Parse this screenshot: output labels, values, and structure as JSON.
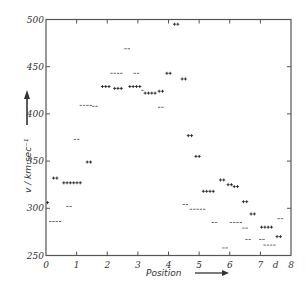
{
  "chart_data": {
    "type": "scatter",
    "title": "",
    "xlabel": "Position",
    "ylabel": "v / km sec⁻¹",
    "xlim": [
      0,
      8
    ],
    "ylim": [
      250,
      500
    ],
    "x_ticks": [
      {
        "value": 0,
        "label": "0"
      },
      {
        "value": 1,
        "label": "1"
      },
      {
        "value": 2,
        "label": "2"
      },
      {
        "value": 3,
        "label": "3"
      },
      {
        "value": 4,
        "label": "4"
      },
      {
        "value": 5,
        "label": "5"
      },
      {
        "value": 6,
        "label": "6"
      },
      {
        "value": 7,
        "label": "7"
      },
      {
        "value": 7.5,
        "label": "d"
      },
      {
        "value": 8,
        "label": "8"
      }
    ],
    "y_ticks": [
      250,
      300,
      350,
      400,
      450,
      500
    ],
    "grid": false,
    "legend": "none",
    "series": [
      {
        "name": "+",
        "marker": "+",
        "points": [
          {
            "x": 0.05,
            "y": 306,
            "n": 1
          },
          {
            "x": 0.3,
            "y": 332,
            "n": 2
          },
          {
            "x": 0.85,
            "y": 327,
            "n": 6
          },
          {
            "x": 1.4,
            "y": 349,
            "n": 2
          },
          {
            "x": 1.95,
            "y": 429,
            "n": 3
          },
          {
            "x": 2.35,
            "y": 427,
            "n": 3
          },
          {
            "x": 2.9,
            "y": 429,
            "n": 4
          },
          {
            "x": 3.4,
            "y": 422,
            "n": 4
          },
          {
            "x": 3.75,
            "y": 424,
            "n": 2
          },
          {
            "x": 4.0,
            "y": 443,
            "n": 2
          },
          {
            "x": 4.25,
            "y": 495,
            "n": 2
          },
          {
            "x": 4.5,
            "y": 437,
            "n": 2
          },
          {
            "x": 4.7,
            "y": 377,
            "n": 2
          },
          {
            "x": 4.95,
            "y": 355,
            "n": 2
          },
          {
            "x": 5.3,
            "y": 318,
            "n": 4
          },
          {
            "x": 5.75,
            "y": 330,
            "n": 2
          },
          {
            "x": 6.0,
            "y": 325,
            "n": 2
          },
          {
            "x": 6.2,
            "y": 323,
            "n": 2
          },
          {
            "x": 6.5,
            "y": 307,
            "n": 2
          },
          {
            "x": 6.75,
            "y": 294,
            "n": 2
          },
          {
            "x": 7.2,
            "y": 280,
            "n": 4
          },
          {
            "x": 7.6,
            "y": 270,
            "n": 2
          }
        ]
      },
      {
        "name": "−",
        "marker": "−",
        "points": [
          {
            "x": 0.3,
            "y": 286,
            "n": 4
          },
          {
            "x": 0.75,
            "y": 302,
            "n": 2
          },
          {
            "x": 1.0,
            "y": 373,
            "n": 2
          },
          {
            "x": 1.3,
            "y": 409,
            "n": 4
          },
          {
            "x": 1.6,
            "y": 408,
            "n": 2
          },
          {
            "x": 2.3,
            "y": 443,
            "n": 4
          },
          {
            "x": 2.65,
            "y": 469,
            "n": 2
          },
          {
            "x": 2.95,
            "y": 443,
            "n": 2
          },
          {
            "x": 3.15,
            "y": 425,
            "n": 1
          },
          {
            "x": 3.75,
            "y": 407,
            "n": 2
          },
          {
            "x": 4.55,
            "y": 304,
            "n": 2
          },
          {
            "x": 4.95,
            "y": 299,
            "n": 5
          },
          {
            "x": 5.5,
            "y": 285,
            "n": 2
          },
          {
            "x": 5.85,
            "y": 258,
            "n": 2
          },
          {
            "x": 6.2,
            "y": 285,
            "n": 4
          },
          {
            "x": 6.5,
            "y": 279,
            "n": 2
          },
          {
            "x": 6.6,
            "y": 267,
            "n": 2
          },
          {
            "x": 7.05,
            "y": 267,
            "n": 2
          },
          {
            "x": 7.3,
            "y": 261,
            "n": 4
          },
          {
            "x": 7.65,
            "y": 289,
            "n": 2
          }
        ]
      }
    ]
  }
}
